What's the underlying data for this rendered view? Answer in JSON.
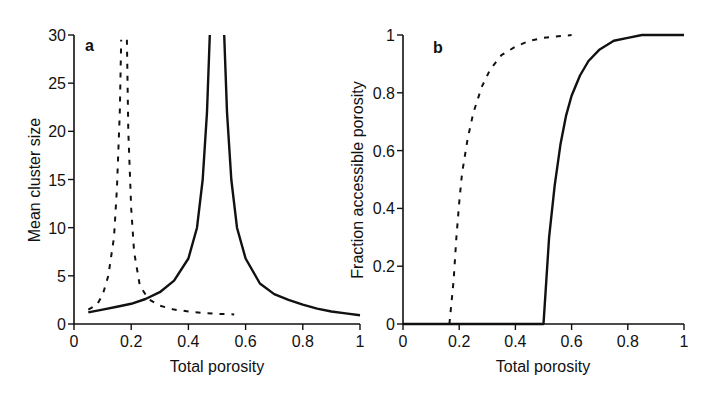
{
  "chart_data": [
    {
      "type": "line",
      "panel_label": "a",
      "title": "",
      "xlabel": "Total porosity",
      "ylabel": "Mean cluster size",
      "xlim": [
        0,
        1
      ],
      "ylim": [
        0,
        30
      ],
      "xticks": [
        "0",
        "0.2",
        "0.4",
        "0.6",
        "0.8",
        "1"
      ],
      "yticks": [
        "0",
        "5",
        "10",
        "15",
        "20",
        "25",
        "30"
      ],
      "grid": false,
      "legend": "none",
      "series": [
        {
          "name": "solid",
          "style": "solid",
          "x": [
            0.05,
            0.1,
            0.15,
            0.2,
            0.25,
            0.3,
            0.35,
            0.4,
            0.43,
            0.45,
            0.465,
            0.475
          ],
          "y": [
            1.2,
            1.5,
            1.8,
            2.1,
            2.6,
            3.3,
            4.5,
            6.8,
            10.0,
            15.0,
            22.0,
            30.0
          ],
          "x2": [
            0.525,
            0.535,
            0.55,
            0.57,
            0.6,
            0.65,
            0.7,
            0.75,
            0.8,
            0.85,
            0.9,
            0.95,
            1.0
          ],
          "y2": [
            30.0,
            22.0,
            15.0,
            10.0,
            6.8,
            4.2,
            3.1,
            2.5,
            2.0,
            1.6,
            1.3,
            1.1,
            0.9
          ]
        },
        {
          "name": "dashed",
          "style": "dashed",
          "x": [
            0.05,
            0.08,
            0.1,
            0.12,
            0.14,
            0.15,
            0.16,
            0.165
          ],
          "y": [
            1.5,
            2.0,
            3.0,
            5.0,
            9.0,
            14.0,
            22.0,
            29.5
          ],
          "x2": [
            0.185,
            0.19,
            0.2,
            0.21,
            0.23,
            0.26,
            0.3,
            0.35,
            0.4,
            0.45,
            0.5,
            0.56
          ],
          "y2": [
            29.5,
            20.0,
            12.0,
            7.5,
            4.0,
            2.6,
            1.9,
            1.5,
            1.3,
            1.15,
            1.05,
            1.0
          ]
        }
      ]
    },
    {
      "type": "line",
      "panel_label": "b",
      "title": "",
      "xlabel": "Total porosity",
      "ylabel": "Fraction accessible porosity",
      "xlim": [
        0,
        1
      ],
      "ylim": [
        0,
        1
      ],
      "xticks": [
        "0",
        "0.2",
        "0.4",
        "0.6",
        "0.8",
        "1"
      ],
      "yticks": [
        "0",
        "0.2",
        "0.4",
        "0.6",
        "0.8",
        "1"
      ],
      "grid": false,
      "legend": "none",
      "series": [
        {
          "name": "solid",
          "style": "solid",
          "x": [
            0.0,
            0.5,
            0.51,
            0.52,
            0.54,
            0.56,
            0.58,
            0.6,
            0.63,
            0.66,
            0.7,
            0.75,
            0.8,
            0.85,
            0.9,
            0.95,
            1.0
          ],
          "y": [
            0.0,
            0.0,
            0.15,
            0.3,
            0.48,
            0.62,
            0.72,
            0.79,
            0.86,
            0.91,
            0.95,
            0.98,
            0.99,
            1.0,
            1.0,
            1.0,
            1.0
          ]
        },
        {
          "name": "dashed",
          "style": "dashed",
          "x": [
            0.165,
            0.18,
            0.19,
            0.2,
            0.21,
            0.23,
            0.25,
            0.28,
            0.31,
            0.35,
            0.4,
            0.45,
            0.5,
            0.6
          ],
          "y": [
            0.0,
            0.15,
            0.3,
            0.42,
            0.52,
            0.64,
            0.73,
            0.82,
            0.88,
            0.93,
            0.96,
            0.98,
            0.99,
            1.0
          ]
        }
      ]
    }
  ],
  "panels": {
    "a": {
      "label": "a",
      "xlabel": "Total porosity",
      "ylabel": "Mean cluster size"
    },
    "b": {
      "label": "b",
      "xlabel": "Total porosity",
      "ylabel": "Fraction accessible porosity"
    }
  }
}
